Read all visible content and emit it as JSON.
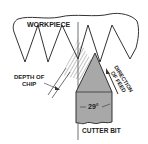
{
  "diagram": {
    "labels": {
      "workpiece": "WORKPIECE",
      "depth_of_chip_line1": "DEPTH OF",
      "depth_of_chip_line2": "CHIP",
      "direction_of_feed_line1": "DIRECTION",
      "direction_of_feed_line2": "OF FEED",
      "angle": "29°",
      "cutter_bit": "CUTTER BIT"
    },
    "colors": {
      "line": "#333333",
      "cutter_fill": "#a8a8a8",
      "hatch": "#555555",
      "background": "#ffffff"
    }
  }
}
